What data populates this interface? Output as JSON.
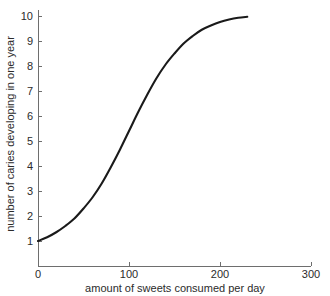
{
  "chart_data": {
    "type": "line",
    "title": "",
    "subtitle": "",
    "xlabel": "amount of sweets consumed per day",
    "ylabel": "number of caries developing in one year",
    "xlim": [
      0,
      300
    ],
    "ylim": [
      1,
      10
    ],
    "xticks": [
      0,
      100,
      200,
      300
    ],
    "xtick_labels": [
      "0",
      "100",
      "200",
      "300"
    ],
    "yticks": [
      1,
      2,
      3,
      4,
      5,
      6,
      7,
      8,
      9,
      10
    ],
    "ytick_labels": [
      "1",
      "2",
      "3",
      "4",
      "5",
      "6",
      "7",
      "8",
      "9",
      "10"
    ],
    "grid": false,
    "legend": false,
    "legend_position": "none",
    "annotations": [],
    "series": [
      {
        "name": "caries vs sweets",
        "color": "#1a1a1a",
        "line_width": 2.1,
        "x": [
          0,
          10,
          20,
          30,
          40,
          50,
          60,
          70,
          80,
          90,
          100,
          110,
          120,
          130,
          140,
          150,
          160,
          170,
          180,
          190,
          200,
          210,
          220,
          230
        ],
        "y": [
          1.0,
          1.15,
          1.35,
          1.6,
          1.9,
          2.3,
          2.75,
          3.3,
          3.95,
          4.65,
          5.4,
          6.15,
          6.85,
          7.5,
          8.05,
          8.5,
          8.9,
          9.2,
          9.45,
          9.62,
          9.76,
          9.86,
          9.93,
          9.97
        ]
      }
    ]
  },
  "axes": {
    "x_axis_label": "amount of sweets consumed per day",
    "y_axis_label": "number of caries developing in one year"
  },
  "colors": {
    "curve": "#1a1a1a",
    "axis": "#6e6e6e",
    "text": "#2b2b2b",
    "background": "#ffffff"
  }
}
